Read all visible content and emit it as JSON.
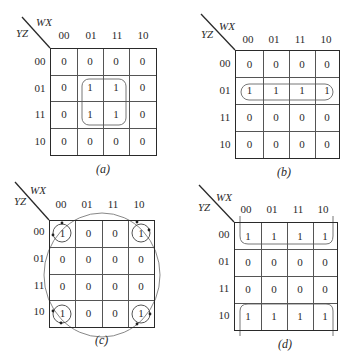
{
  "maps": [
    {
      "id": "a",
      "caption": "(a)",
      "column_variables": "WX",
      "row_variables": "YZ",
      "column_labels": [
        "00",
        "01",
        "11",
        "10"
      ],
      "row_labels": [
        "00",
        "01",
        "11",
        "10"
      ],
      "cells": [
        [
          "0",
          "0",
          "0",
          "0"
        ],
        [
          "0",
          "1",
          "1",
          "0"
        ],
        [
          "0",
          "1",
          "1",
          "0"
        ],
        [
          "0",
          "0",
          "0",
          "0"
        ]
      ],
      "grouping": "2x2 block: rows 01,11 x columns 01,11"
    },
    {
      "id": "b",
      "caption": "(b)",
      "column_variables": "WX",
      "row_variables": "YZ",
      "column_labels": [
        "00",
        "01",
        "11",
        "10"
      ],
      "row_labels": [
        "00",
        "01",
        "11",
        "10"
      ],
      "cells": [
        [
          "0",
          "0",
          "0",
          "0"
        ],
        [
          "1",
          "1",
          "1",
          "1"
        ],
        [
          "0",
          "0",
          "0",
          "0"
        ],
        [
          "0",
          "0",
          "0",
          "0"
        ]
      ],
      "grouping": "row 01, all four columns"
    },
    {
      "id": "c",
      "caption": "(c)",
      "column_variables": "WX",
      "row_variables": "YZ",
      "column_labels": [
        "00",
        "01",
        "11",
        "10"
      ],
      "row_labels": [
        "00",
        "01",
        "11",
        "10"
      ],
      "cells": [
        [
          "1",
          "0",
          "0",
          "1"
        ],
        [
          "0",
          "0",
          "0",
          "0"
        ],
        [
          "0",
          "0",
          "0",
          "0"
        ],
        [
          "1",
          "0",
          "0",
          "1"
        ]
      ],
      "grouping": "four corners wrapping around"
    },
    {
      "id": "d",
      "caption": "(d)",
      "column_variables": "WX",
      "row_variables": "YZ",
      "column_labels": [
        "00",
        "01",
        "11",
        "10"
      ],
      "row_labels": [
        "00",
        "01",
        "11",
        "10"
      ],
      "cells": [
        [
          "1",
          "1",
          "1",
          "1"
        ],
        [
          "0",
          "0",
          "0",
          "0"
        ],
        [
          "0",
          "0",
          "0",
          "0"
        ],
        [
          "1",
          "1",
          "1",
          "1"
        ]
      ],
      "grouping": "rows 00 and 10 wrapping top/bottom"
    }
  ]
}
